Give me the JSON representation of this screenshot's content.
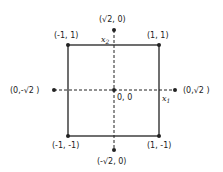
{
  "diagram": {
    "square_corners": [
      {
        "label": "(-1, 1)"
      },
      {
        "label": "(1, 1)"
      },
      {
        "label": "(-1, -1)"
      },
      {
        "label": "(1, -1)"
      }
    ],
    "center": {
      "label": "0, 0"
    },
    "axis_points": {
      "top": {
        "label": "(√2, 0)"
      },
      "bottom": {
        "label": "(-√2, 0)"
      },
      "left": {
        "label": "(0,-√2 )"
      },
      "right": {
        "label": "(0,√2 )"
      }
    },
    "axes": {
      "horizontal": {
        "name": "x",
        "sub": "1"
      },
      "vertical": {
        "name": "x",
        "sub": "2"
      }
    },
    "colors": {
      "line": "#222222",
      "background": "#ffffff"
    }
  }
}
